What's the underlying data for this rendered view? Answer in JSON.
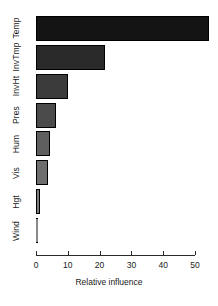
{
  "chart_data": {
    "type": "bar",
    "orientation": "horizontal",
    "title": "",
    "subtitle": "",
    "xlabel": "Relative influence",
    "ylabel": "",
    "categories": [
      "Wind",
      "Hgt",
      "Vis",
      "Hum",
      "Pres",
      "InvHt",
      "InvTmp",
      "Temp"
    ],
    "values": [
      0.2,
      1.3,
      3.9,
      4.4,
      6.3,
      10.1,
      21.7,
      54.4
    ],
    "xlim": [
      0,
      53.5
    ],
    "xticks": [
      0,
      10,
      20,
      30,
      40,
      50
    ],
    "xticklabels": [
      "0",
      "10",
      "20",
      "30",
      "40",
      "50"
    ],
    "grid": false,
    "legend": null,
    "bar_colors": [
      "#8a8a8a",
      "#7d7d7d",
      "#6e6e6e",
      "#5f5f5f",
      "#4b4b4b",
      "#3b3b3b",
      "#2a2a2a",
      "#141414"
    ],
    "bar_border_color": "#000000",
    "axis_color": "#2b2b2b",
    "background": "#ffffff",
    "series": [
      {
        "name": "Relative influence",
        "points": [
          {
            "category": "Temp",
            "value": 54.4
          },
          {
            "category": "InvTmp",
            "value": 21.7
          },
          {
            "category": "InvHt",
            "value": 10.1
          },
          {
            "category": "Pres",
            "value": 6.3
          },
          {
            "category": "Hum",
            "value": 4.4
          },
          {
            "category": "Vis",
            "value": 3.9
          },
          {
            "category": "Hgt",
            "value": 1.3
          },
          {
            "category": "Wind",
            "value": 0.2
          }
        ]
      }
    ]
  }
}
